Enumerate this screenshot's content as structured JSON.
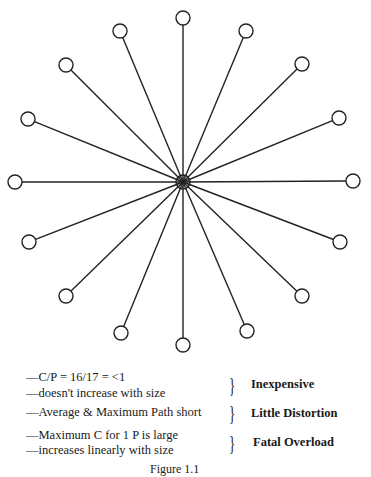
{
  "diagram": {
    "type": "star-network",
    "hub": {
      "x": 183,
      "y": 182,
      "fill": "hatched"
    },
    "node_count": 16,
    "nodes": [
      {
        "x": 183,
        "y": 18
      },
      {
        "x": 246,
        "y": 31
      },
      {
        "x": 302,
        "y": 64
      },
      {
        "x": 339,
        "y": 118
      },
      {
        "x": 353,
        "y": 181
      },
      {
        "x": 340,
        "y": 242
      },
      {
        "x": 302,
        "y": 296
      },
      {
        "x": 247,
        "y": 331
      },
      {
        "x": 183,
        "y": 345
      },
      {
        "x": 121,
        "y": 333
      },
      {
        "x": 66,
        "y": 296
      },
      {
        "x": 29,
        "y": 242
      },
      {
        "x": 15,
        "y": 182
      },
      {
        "x": 28,
        "y": 119
      },
      {
        "x": 66,
        "y": 65
      },
      {
        "x": 120,
        "y": 31
      }
    ]
  },
  "notes": [
    {
      "lines": [
        "—C/P = 16/17 = <1",
        "—doesn't increase with size"
      ],
      "label": "Inexpensive"
    },
    {
      "lines": [
        "—Average & Maximum Path short"
      ],
      "label": "Little Distortion"
    },
    {
      "lines": [
        "—Maximum C for 1 P is large",
        "—increases linearly with size"
      ],
      "label": "Fatal Overload"
    }
  ],
  "caption": "Figure 1.1"
}
